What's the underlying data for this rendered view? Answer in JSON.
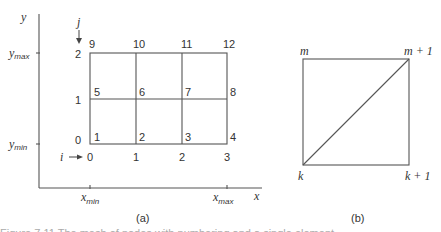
{
  "panel_a": {
    "axis_y_label": "y",
    "axis_x_label": "x",
    "y_max_label": "y",
    "y_max_sub": "max",
    "y_min_label": "y",
    "y_min_sub": "min",
    "x_min_label": "x",
    "x_min_sub": "min",
    "x_max_label": "x",
    "x_max_sub": "max",
    "j_label": "j",
    "i_label": "i",
    "j_index_labels": [
      "0",
      "1",
      "2"
    ],
    "i_index_labels": [
      "0",
      "1",
      "2",
      "3"
    ],
    "node_labels": [
      "1",
      "2",
      "3",
      "4",
      "5",
      "6",
      "7",
      "8",
      "9",
      "10",
      "11",
      "12"
    ],
    "caption": "(a)"
  },
  "panel_b": {
    "top_left": "m",
    "top_right": "m + 1",
    "bottom_left": "k",
    "bottom_right": "k + 1",
    "caption": "(b)"
  },
  "footer_partial_text": "Figure 7.11  The mesh of nodes with numbering and a single element"
}
